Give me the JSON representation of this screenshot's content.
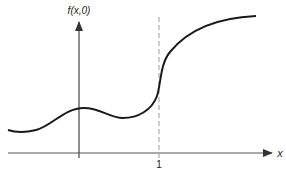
{
  "figure": {
    "y_axis_label": "f(x,0)",
    "x_axis_label": "x",
    "tick_label": "1",
    "colors": {
      "curve": "#1a1a1a",
      "axes": "#555555",
      "dashed_line": "#999999",
      "background": "#ffffff"
    },
    "elements": {
      "curve": "smooth function f(x,0): low on the left, small hump near x=0, dip, steep rise at x=1, saturating plateau on the right",
      "dashed_line": "vertical dashed line at x = 1"
    }
  }
}
